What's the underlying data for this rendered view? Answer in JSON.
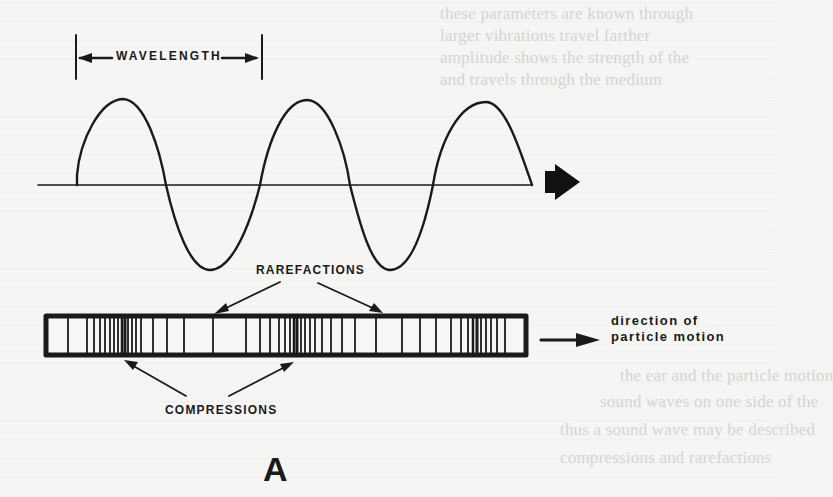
{
  "figure": {
    "panel_label": "A",
    "labels": {
      "wavelength": "WAVELENGTH",
      "rarefactions": "RAREFACTIONS",
      "compressions": "COMPRESSIONS",
      "direction_line1": "direction of",
      "direction_line2": "particle motion"
    },
    "wave": {
      "type": "transverse-sine-representation",
      "cycles": 2.5,
      "baseline_y": 185,
      "start_x": 77,
      "end_x": 532,
      "peaks_x": [
        123,
        307,
        486
      ],
      "troughs_x": [
        210,
        390
      ],
      "propagation_arrow": "right"
    },
    "compression_bar": {
      "x": 44,
      "y": 314,
      "width": 484,
      "height": 43,
      "compression_centers_x": [
        125,
        295,
        478
      ],
      "rarefaction_centers_x": [
        213,
        390
      ]
    },
    "annotation_arrows": {
      "rarefactions": 2,
      "compressions": 2
    },
    "colors": {
      "ink": "#1a1a1a",
      "paper": "#f5f5f3",
      "bleed_through": "#d4d4d2"
    }
  },
  "background_bleed": {
    "lines": [
      "these parameters are known through",
      "larger vibrations travel farther",
      "amplitude shows the strength of the",
      "and travels through the medium",
      "the ear and the particle motion",
      "sound waves on one side of the",
      "thus a sound wave may be described",
      "compressions and rarefactions"
    ]
  }
}
